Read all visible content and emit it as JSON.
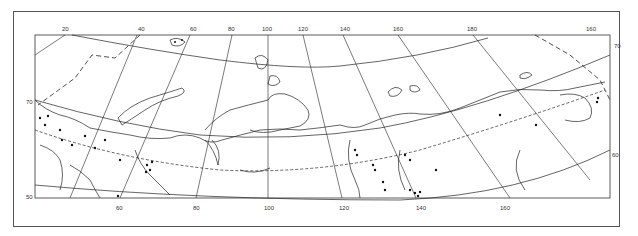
{
  "map": {
    "projection": "conic",
    "region": "Northern Eurasia / Russian Arctic",
    "top_longitude_labels": [
      "20",
      "40",
      "60",
      "80",
      "100",
      "120",
      "140",
      "160",
      "180",
      "160"
    ],
    "bottom_longitude_labels": [
      "60",
      "80",
      "100",
      "120",
      "140",
      "160"
    ],
    "left_latitude_labels": [
      "70",
      "50"
    ],
    "right_latitude_labels": [
      "70",
      "60"
    ],
    "legend": {
      "dots": "observation sites",
      "dashed_line": "boundary",
      "long_dash_line": "border"
    },
    "colors": {
      "line": "#222222",
      "frame": "#555555",
      "background": "#ffffff",
      "dot": "#111111"
    }
  }
}
